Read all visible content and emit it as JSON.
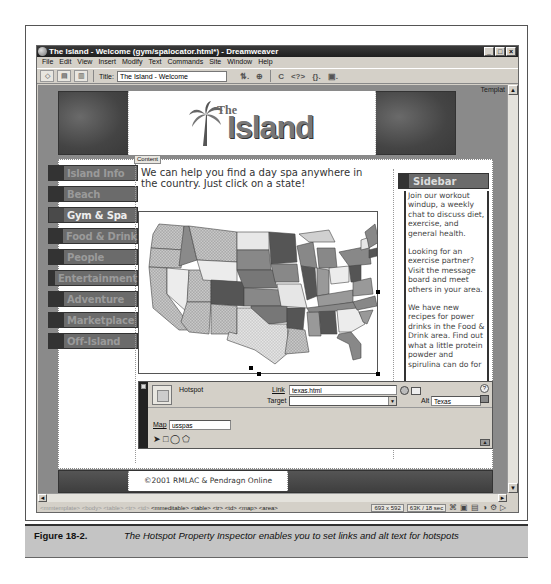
{
  "window": {
    "title": "The Island - Welcome (gym/spalocator.html*) - Dreamweaver",
    "controls": {
      "minimize": "_",
      "maximize": "□",
      "close": "×"
    }
  },
  "menubar": [
    "File",
    "Edit",
    "View",
    "Insert",
    "Modify",
    "Text",
    "Commands",
    "Site",
    "Window",
    "Help"
  ],
  "toolbar": {
    "title_label": "Title:",
    "title_value": "The Island - Welcome",
    "icons": [
      "code-view",
      "split-view",
      "design-view",
      "file-management",
      "preview-browser",
      "refresh",
      "reference",
      "code-navigation",
      "view-options"
    ],
    "glyphs": {
      "preview": "⊕",
      "refresh": "C",
      "reference": "<?>",
      "code_nav": "{}.",
      "view_options": "▣."
    }
  },
  "document": {
    "template_label": "Templat",
    "logo": {
      "small": "The",
      "large": "Island",
      "palm": "🌴"
    },
    "content_tag": "Content",
    "nav": [
      {
        "label": "Island Info",
        "active": false
      },
      {
        "label": "Beach",
        "active": false
      },
      {
        "label": "Gym & Spa",
        "active": true
      },
      {
        "label": "Food & Drink",
        "active": false
      },
      {
        "label": "People",
        "active": false
      },
      {
        "label": "Entertainment",
        "active": false
      },
      {
        "label": "Adventure",
        "active": false
      },
      {
        "label": "Marketplace",
        "active": false
      },
      {
        "label": "Off-Island",
        "active": false
      }
    ],
    "intro": "We can help you find a day spa anywhere in the country. Just click on a state!",
    "map_alt": "US states map",
    "sidebar": {
      "title": "Sidebar",
      "paragraphs": [
        "Join our workout windup, a weekly chat to discuss diet, exercise, and general health.",
        "Looking for an exercise partner? Visit the message board and meet others in your area.",
        "We have new recipes for power drinks in the Food & Drink area. Find out what a little protein powder and spirulina can do for"
      ]
    },
    "footer": "©2001 RMLAC & Pendragn Online"
  },
  "inspector": {
    "type_label": "Hotspot",
    "link_label": "Link",
    "link_value": "texas.html",
    "target_label": "Target",
    "target_value": "",
    "alt_label": "Alt",
    "alt_value": "Texas",
    "map_label": "Map",
    "map_value": "usspas",
    "tools": {
      "pointer": "➤",
      "rect": "□",
      "oval": "◯",
      "polygon": "⬠"
    },
    "help": "?"
  },
  "statusbar": {
    "tags_dim": "<mmtemplate> <body> <table> <tr> <td>",
    "tags_sel": "<mmeditable> <table> <tr> <td> <map> <area>",
    "window_size": "693 x 592",
    "download": "63K / 18 sec",
    "launcher_icons": [
      "site",
      "assets",
      "html-styles",
      "css-styles",
      "behaviors",
      "history"
    ]
  },
  "caption": {
    "number": "Figure 18-2.",
    "text": "The Hotspot Property Inspector enables you to set links and alt text for hotspots"
  },
  "colors": {
    "titlebar": "#1e1e1e",
    "chrome": "#d4d0c8",
    "nav_bg": "#6b6b6b",
    "page_bg": "#8a8a8a",
    "caption_bg": "#c4c4c4"
  }
}
